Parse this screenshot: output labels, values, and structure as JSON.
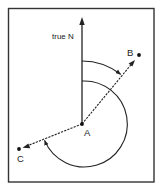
{
  "diagram": {
    "type": "bearing-diagram",
    "labels": {
      "north": "true N",
      "point_a": "A",
      "point_b": "B",
      "point_c": "C"
    },
    "points": {
      "A": {
        "x": 82,
        "y": 124
      },
      "B": {
        "x": 139,
        "y": 55
      },
      "C": {
        "x": 19,
        "y": 149
      }
    },
    "angles": {
      "bearing_AB_deg_approx": 40,
      "bearing_AC_deg_approx": 248
    },
    "colors": {
      "stroke": "#222222",
      "frame": "#333333",
      "background": "#ffffff"
    }
  }
}
